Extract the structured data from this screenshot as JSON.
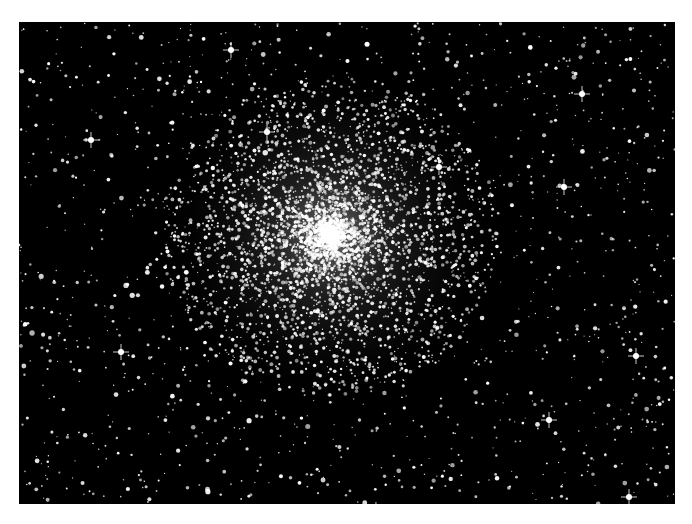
{
  "image": {
    "subject": "globular star cluster",
    "description": "Black-and-white astronomical photograph of a dense globular star cluster with field stars",
    "background": "#000000",
    "page_background": "#ffffff",
    "frame": {
      "x": 19,
      "y": 22,
      "width": 656,
      "height": 482
    },
    "cluster_center": {
      "x": 330,
      "y": 235
    },
    "cluster_radius": 170,
    "star_color": "#ffffff"
  }
}
